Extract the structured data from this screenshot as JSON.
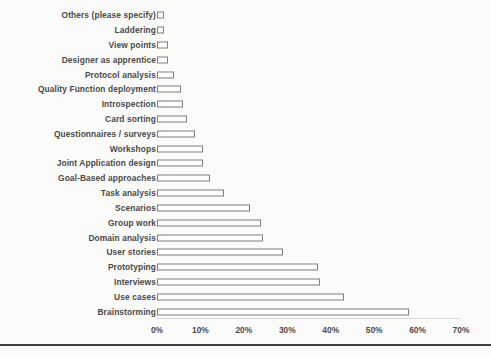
{
  "chart_data": {
    "type": "bar",
    "orientation": "horizontal",
    "title": "",
    "xlabel": "",
    "ylabel": "",
    "xlim": [
      0,
      70
    ],
    "grid": false,
    "legend": null,
    "xtick_labels": [
      "0%",
      "10%",
      "20%",
      "30%",
      "40%",
      "50%",
      "60%",
      "70%"
    ],
    "xtick_values": [
      0,
      10,
      20,
      30,
      40,
      50,
      60,
      70
    ],
    "categories": [
      "Others (please specify)",
      "Laddering",
      "View points",
      "Designer as  apprentice",
      "Protocol analysis",
      "Quality Function deployment",
      "Introspection",
      "Card sorting",
      "Questionnaires / surveys",
      "Workshops",
      "Joint Application design",
      "Goal-Based approaches",
      "Task analysis",
      "Scenarios",
      "Group work",
      "Domain analysis",
      "User stories",
      "Prototyping",
      "Interviews",
      "Use cases",
      "Brainstorming"
    ],
    "values": [
      1.5,
      1.5,
      2.5,
      2.5,
      4,
      5.5,
      6,
      7,
      8.8,
      10.5,
      10.5,
      12.3,
      15.5,
      21.5,
      24,
      24.5,
      29,
      37,
      37.5,
      43,
      58
    ],
    "bar_fill_color": "#ffffff",
    "bar_edge_color": "#7d7d7d",
    "label_color": "#4a4a4a",
    "background_color": "#fbfbfa"
  }
}
